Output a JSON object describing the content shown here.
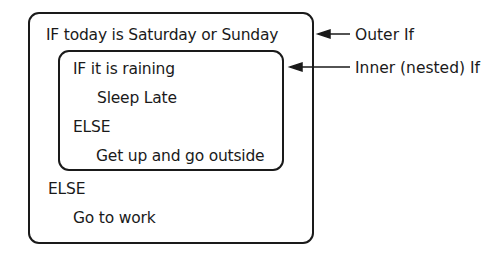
{
  "diagram": {
    "outer_block": {
      "lines": [
        "IF today is Saturday or Sunday",
        "ELSE",
        "Go to work"
      ]
    },
    "inner_block": {
      "lines": [
        "IF it is raining",
        "Sleep Late",
        "ELSE",
        "Get up and go outside"
      ]
    },
    "annotations": [
      {
        "label": "Outer If",
        "points_to": "outer_block"
      },
      {
        "label": "Inner (nested) If",
        "points_to": "inner_block"
      }
    ],
    "colors": {
      "stroke": "#1a1a1a",
      "background": "#ffffff"
    }
  }
}
